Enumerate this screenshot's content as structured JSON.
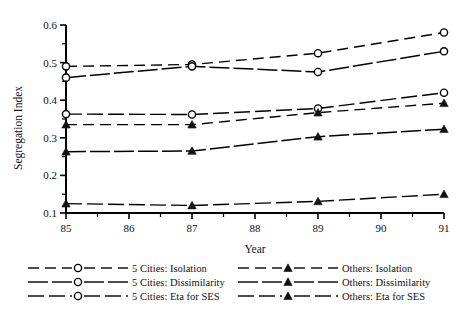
{
  "chart_data": {
    "type": "line",
    "title": "",
    "xlabel": "Year",
    "ylabel": "Segregation Index",
    "x": [
      85,
      87,
      89,
      91
    ],
    "xlim": [
      85,
      91
    ],
    "ylim": [
      0.1,
      0.6
    ],
    "xticks": [
      "85",
      "86",
      "87",
      "88",
      "89",
      "90",
      "91"
    ],
    "yticks": [
      "0.1",
      "0.2",
      "0.3",
      "0.4",
      "0.5",
      "0.6"
    ],
    "grid": false,
    "legend_position": "below-plot-two-columns",
    "series": [
      {
        "name": "5 Cities: Isolation",
        "marker": "circle",
        "dash": "long-dash",
        "values": [
          0.49,
          0.495,
          0.525,
          0.58
        ]
      },
      {
        "name": "5 Cities: Dissimilarity",
        "marker": "circle",
        "dash": "solid",
        "values": [
          0.46,
          0.49,
          0.475,
          0.53
        ]
      },
      {
        "name": "5 Cities: Eta for SES",
        "marker": "circle",
        "dash": "dash-dot",
        "values": [
          0.363,
          0.362,
          0.378,
          0.42
        ]
      },
      {
        "name": "Others: Isolation",
        "marker": "triangle",
        "dash": "long-dash",
        "values": [
          0.335,
          0.335,
          0.367,
          0.392
        ]
      },
      {
        "name": "Others: Dissimilarity",
        "marker": "triangle",
        "dash": "solid",
        "values": [
          0.263,
          0.265,
          0.303,
          0.323
        ]
      },
      {
        "name": "Others: Eta for SES",
        "marker": "triangle",
        "dash": "dash-dot",
        "values": [
          0.125,
          0.12,
          0.131,
          0.15
        ]
      }
    ]
  },
  "axes": {
    "x_title": "Year",
    "y_title": "Segregation Index",
    "x_tick_labels": [
      "85",
      "86",
      "87",
      "88",
      "89",
      "90",
      "91"
    ],
    "y_tick_labels": [
      "0.6",
      "0.5",
      "0.4",
      "0.3",
      "0.2",
      "0.1"
    ]
  },
  "legend": {
    "left_column": [
      {
        "label": "5 Cities:  Isolation"
      },
      {
        "label": "5 Cities:  Dissimilarity"
      },
      {
        "label": "5 Cities:  Eta for SES"
      }
    ],
    "right_column": [
      {
        "label": "Others:  Isolation"
      },
      {
        "label": "Others:  Dissimilarity"
      },
      {
        "label": "Others:  Eta for SES"
      }
    ]
  },
  "colors": {
    "ink": "#111111",
    "background": "#ffffff",
    "marker_fill_open": "#ffffff",
    "marker_fill_solid": "#111111"
  }
}
